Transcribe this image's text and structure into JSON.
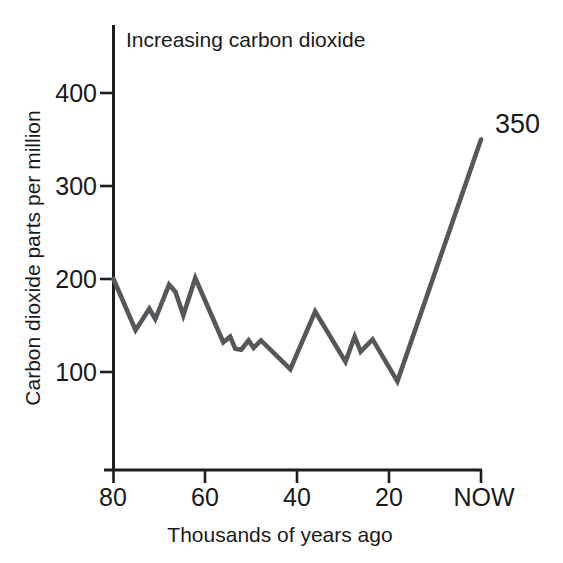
{
  "chart_data": {
    "type": "line",
    "title": "Increasing carbon dioxide",
    "xlabel": "Thousands of years ago",
    "ylabel": "Carbon dioxide parts per million",
    "grid": false,
    "legend": "none",
    "xlim": [
      80,
      0
    ],
    "ylim": [
      0,
      430
    ],
    "x_axis_direction": "reversed",
    "xticks": [
      80,
      60,
      40,
      20,
      0
    ],
    "xticklabels": [
      "80",
      "60",
      "40",
      "20",
      "NOW"
    ],
    "yticks": [
      100,
      200,
      300,
      400
    ],
    "yticklabels": [
      "100",
      "200",
      "300",
      "400"
    ],
    "annotations": [
      {
        "text": "350",
        "x": 0,
        "y": 350
      }
    ],
    "series": [
      {
        "name": "Atmospheric CO2",
        "color": "#55585a",
        "points": [
          {
            "x": 80.0,
            "y": 200
          },
          {
            "x": 75.2,
            "y": 145
          },
          {
            "x": 72.2,
            "y": 168
          },
          {
            "x": 70.9,
            "y": 157
          },
          {
            "x": 67.9,
            "y": 194
          },
          {
            "x": 66.5,
            "y": 186
          },
          {
            "x": 64.8,
            "y": 161
          },
          {
            "x": 62.2,
            "y": 201
          },
          {
            "x": 56.1,
            "y": 132
          },
          {
            "x": 54.6,
            "y": 138
          },
          {
            "x": 53.5,
            "y": 125
          },
          {
            "x": 52.2,
            "y": 124
          },
          {
            "x": 50.6,
            "y": 134
          },
          {
            "x": 49.5,
            "y": 126
          },
          {
            "x": 47.9,
            "y": 134
          },
          {
            "x": 41.5,
            "y": 103
          },
          {
            "x": 36.1,
            "y": 165
          },
          {
            "x": 29.5,
            "y": 111
          },
          {
            "x": 27.5,
            "y": 138
          },
          {
            "x": 26.2,
            "y": 122
          },
          {
            "x": 23.6,
            "y": 135
          },
          {
            "x": 18.2,
            "y": 90
          },
          {
            "x": 0.0,
            "y": 350
          }
        ]
      }
    ]
  },
  "figure": {
    "background_color": "#ffffff",
    "axis_color": "#1d1d1d",
    "line_color": "#55585a"
  }
}
